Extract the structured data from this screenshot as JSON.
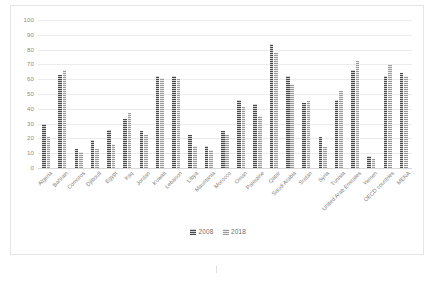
{
  "chart_data": {
    "type": "bar",
    "title": "",
    "subtitle": "",
    "xlabel": "",
    "ylabel": "",
    "ylim": [
      0,
      100
    ],
    "ytick_step": 10,
    "yticks": [
      "0",
      "10",
      "20",
      "30",
      "40",
      "50",
      "60",
      "70",
      "80",
      "90",
      "100"
    ],
    "grid": true,
    "legend_position": "bottom",
    "categories": [
      "Algeria",
      "Bahrain",
      "Comoros",
      "Djibouti",
      "Egypt",
      "Iraq",
      "Jordan",
      "Kuwait",
      "Lebanon",
      "Libya",
      "Mauritania",
      "Morocco",
      "Oman",
      "Palestine",
      "Qatar",
      "Saudi Arabia",
      "Sudan",
      "Syria",
      "Tunisia",
      "United Arab Emirates",
      "Yemen",
      "OECD countries",
      "MENA"
    ],
    "series": [
      {
        "name": "2008",
        "color": "#4a4a4a",
        "values": [
          30,
          63,
          13,
          19,
          26,
          33,
          25,
          62,
          62,
          22,
          15,
          25,
          46,
          43,
          84,
          62,
          44,
          21,
          46,
          66,
          8,
          62,
          64
        ]
      },
      {
        "name": "2018",
        "color": "#9a9a9a",
        "values": [
          21,
          66,
          11,
          13,
          16,
          37,
          22,
          61,
          60,
          15,
          12,
          22,
          41,
          35,
          78,
          57,
          45,
          14,
          52,
          72,
          6,
          70,
          62
        ]
      }
    ]
  },
  "legend": {
    "items": [
      {
        "label": "2008"
      },
      {
        "label": "2018"
      }
    ]
  }
}
